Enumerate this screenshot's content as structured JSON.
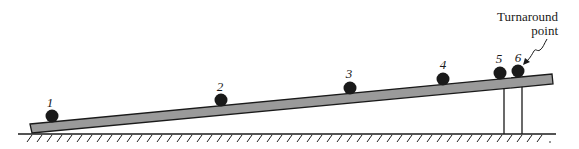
{
  "diagram": {
    "annotation": {
      "line1": "Turnaround",
      "line2": "point"
    },
    "positions": [
      {
        "label": "1"
      },
      {
        "label": "2"
      },
      {
        "label": "3"
      },
      {
        "label": "4"
      },
      {
        "label": "5"
      },
      {
        "label": "6"
      }
    ],
    "colors": {
      "ramp_fill": "#9a9a9a",
      "ball": "#1a1a1a",
      "line": "#1a1a1a"
    }
  }
}
